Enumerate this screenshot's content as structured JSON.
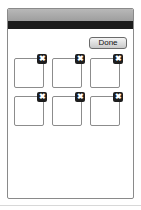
{
  "toolbar": {
    "done_label": "Done"
  },
  "tiles": [
    {
      "row": 1,
      "col": 1,
      "close_icon": "✖"
    },
    {
      "row": 1,
      "col": 2,
      "close_icon": "✖"
    },
    {
      "row": 1,
      "col": 3,
      "close_icon": "✖"
    },
    {
      "row": 2,
      "col": 1,
      "close_icon": "✖"
    },
    {
      "row": 2,
      "col": 2,
      "close_icon": "✖"
    },
    {
      "row": 2,
      "col": 3,
      "close_icon": "✖"
    }
  ],
  "colors": {
    "title_bar": "#a8a8a8",
    "toolbar": "#1c1c1c",
    "close_badge": "#1e1e1e",
    "tile_border": "#8c8c8c"
  }
}
